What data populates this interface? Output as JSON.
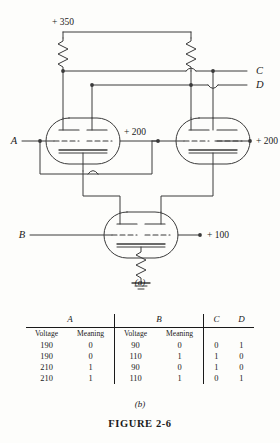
{
  "figure": {
    "caption": "FIGURE 2-6",
    "panel_a_label": "(a)",
    "panel_b_label": "(b)"
  },
  "circuit": {
    "supply_label": "+ 350",
    "input_a_label": "A",
    "input_b_label": "B",
    "output_c_label": "C",
    "output_d_label": "D",
    "left_tube_output_label": "+ 200",
    "right_tube_output_label": "+ 200",
    "bottom_tube_output_label": "+ 100",
    "components": {
      "resistor_left": "plate-load-resistor-left",
      "resistor_right": "plate-load-resistor-right",
      "resistor_cathode": "cathode-resistor",
      "ground": "ground-symbol",
      "tube_left": "vacuum-tube-left",
      "tube_right": "vacuum-tube-right",
      "tube_bottom": "vacuum-tube-bottom"
    },
    "colors": {
      "wire": "#3a3a3a",
      "background": "#fdfdfb"
    }
  },
  "table": {
    "group_headers": [
      "A",
      "B",
      "C",
      "D"
    ],
    "sub_headers": [
      "Voltage",
      "Meaning",
      "Voltage",
      "Meaning"
    ],
    "rows": [
      {
        "a_voltage": "190",
        "a_meaning": "0",
        "b_voltage": "90",
        "b_meaning": "0",
        "c": "0",
        "d": "1"
      },
      {
        "a_voltage": "190",
        "a_meaning": "0",
        "b_voltage": "110",
        "b_meaning": "1",
        "c": "1",
        "d": "0"
      },
      {
        "a_voltage": "210",
        "a_meaning": "1",
        "b_voltage": "90",
        "b_meaning": "0",
        "c": "1",
        "d": "0"
      },
      {
        "a_voltage": "210",
        "a_meaning": "1",
        "b_voltage": "110",
        "b_meaning": "1",
        "c": "0",
        "d": "1"
      }
    ]
  }
}
